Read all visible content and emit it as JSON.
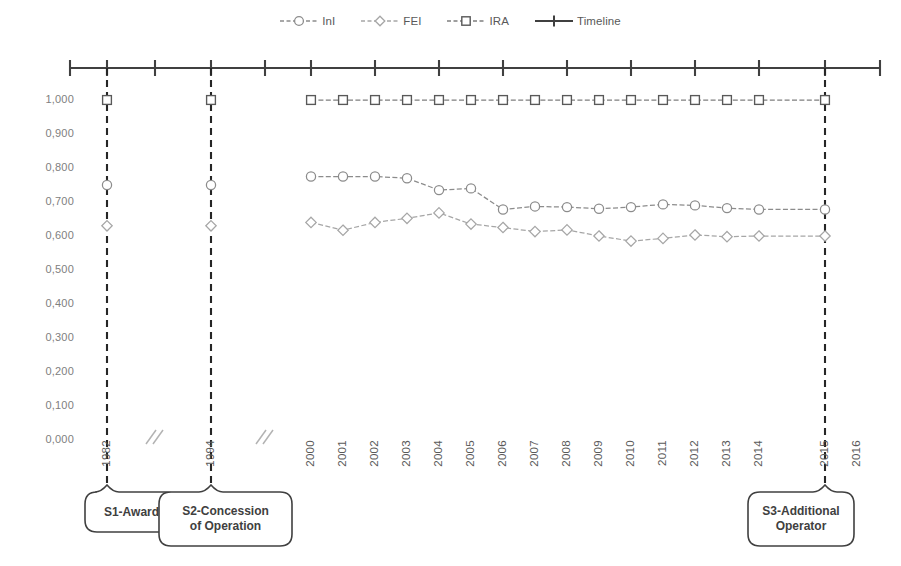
{
  "legend": {
    "position": "top-center",
    "items": [
      {
        "label": "InI",
        "marker": "circle-marker-icon",
        "color": "#808080",
        "dash": "dashed"
      },
      {
        "label": "FEI",
        "marker": "diamond-marker-icon",
        "color": "#a6a6a6",
        "dash": "dashed"
      },
      {
        "label": "IRA",
        "marker": "square-marker-icon",
        "color": "#7f7f7f",
        "dash": "dashed"
      },
      {
        "label": "Timeline",
        "marker": "plus-marker-icon",
        "color": "#404040",
        "dash": "solid"
      }
    ]
  },
  "axes": {
    "y_ticks": [
      "1,000",
      "0,900",
      "0,800",
      "0,700",
      "0,600",
      "0,500",
      "0,400",
      "0,300",
      "0,200",
      "0,100",
      "0,000"
    ],
    "x_ticks": [
      "1982",
      "1994",
      "2000",
      "2001",
      "2002",
      "2003",
      "2004",
      "2005",
      "2006",
      "2007",
      "2008",
      "2009",
      "2010",
      "2011",
      "2012",
      "2013",
      "2014",
      "2015",
      "2016"
    ],
    "y_min": "0,000",
    "y_max": "1,000",
    "breaks": 2,
    "grid": "off"
  },
  "callouts": [
    {
      "id": "s1",
      "label": "S1-Award",
      "year": "1982"
    },
    {
      "id": "s2",
      "label": "S2-Concession\nof Operation",
      "line1": "S2-Concession",
      "line2": "of Operation",
      "year": "1994"
    },
    {
      "id": "s3",
      "label": "S3-Additional\nOperator",
      "line1": "S3-Additional",
      "line2": "Operator",
      "year": "2015"
    }
  ],
  "colors": {
    "ini": "#8c8c8c",
    "fei": "#a6a6a6",
    "ira": "#7f7f7f",
    "timeline": "#404040",
    "marker_event": "#262626",
    "axis_text": "#595959",
    "y_text": "#808080",
    "background": "#ffffff"
  },
  "chart_data": {
    "type": "line",
    "title": "",
    "subtitle": "",
    "xlabel": "",
    "ylabel": "",
    "ylim": [
      0,
      1.0
    ],
    "ytick_step": 0.1,
    "grid": false,
    "legend_position": "top-center",
    "x": [
      "1982",
      "1994",
      "2000",
      "2001",
      "2002",
      "2003",
      "2004",
      "2005",
      "2006",
      "2007",
      "2008",
      "2009",
      "2010",
      "2011",
      "2012",
      "2013",
      "2014",
      "2015",
      "2016"
    ],
    "axis_breaks_after": [
      "1982",
      "1994"
    ],
    "series": [
      {
        "name": "InI",
        "marker": "circle",
        "color": "#8c8c8c",
        "values": [
          0.75,
          0.75,
          0.775,
          0.775,
          0.775,
          0.77,
          0.735,
          0.74,
          0.678,
          0.687,
          0.685,
          0.68,
          0.685,
          0.693,
          0.69,
          0.682,
          0.678,
          0.678,
          null
        ]
      },
      {
        "name": "FEI",
        "marker": "diamond",
        "color": "#a6a6a6",
        "values": [
          0.63,
          0.63,
          0.64,
          0.617,
          0.64,
          0.652,
          0.668,
          0.635,
          0.625,
          0.613,
          0.618,
          0.6,
          0.585,
          0.593,
          0.603,
          0.598,
          0.6,
          0.6,
          null
        ]
      },
      {
        "name": "IRA",
        "marker": "square",
        "color": "#7f7f7f",
        "values": [
          1.0,
          1.0,
          1.0,
          1.0,
          1.0,
          1.0,
          1.0,
          1.0,
          1.0,
          1.0,
          1.0,
          1.0,
          1.0,
          1.0,
          1.0,
          1.0,
          1.0,
          1.0,
          null
        ]
      },
      {
        "name": "Timeline",
        "marker": "plus",
        "color": "#404040",
        "note": "horizontal timeline axis drawn above the plot with tick marks at each year"
      }
    ],
    "event_markers": [
      {
        "label": "S1-Award",
        "x": "1982"
      },
      {
        "label": "S2-Concession of Operation",
        "x": "1994"
      },
      {
        "label": "S3-Additional Operator",
        "x": "2015"
      }
    ]
  }
}
